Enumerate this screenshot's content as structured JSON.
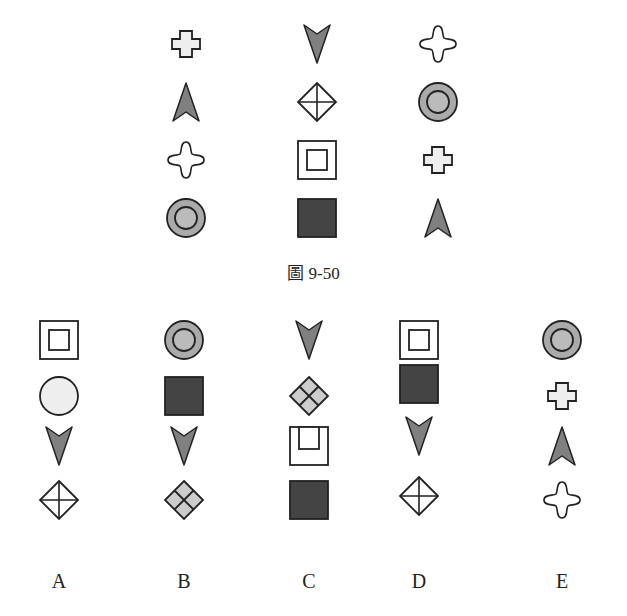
{
  "figure": {
    "caption": "圖 9-50",
    "colors": {
      "stroke": "#222222",
      "light_fill": "#eeeeee",
      "mid_fill": "#aaaaaa",
      "arrow_fill": "#808080",
      "dark_fill": "#444444",
      "white": "#ffffff"
    },
    "grid": {
      "columns": [
        [
          "cross",
          "arrow-up",
          "four-point-star",
          "ring"
        ],
        [
          "arrow-down",
          "diamond-cross",
          "nested-square",
          "dark-square"
        ],
        [
          "four-point-star",
          "ring",
          "cross",
          "arrow-up"
        ]
      ]
    }
  },
  "options": [
    {
      "label": "A",
      "shapes": [
        "nested-square",
        "circle",
        "arrow-down",
        "diamond-cross"
      ]
    },
    {
      "label": "B",
      "shapes": [
        "ring",
        "dark-square",
        "arrow-down",
        "diamond-quad"
      ]
    },
    {
      "label": "C",
      "shapes": [
        "arrow-down",
        "diamond-quad",
        "nested-square-offset",
        "dark-square"
      ]
    },
    {
      "label": "D",
      "shapes": [
        "nested-square",
        "dark-square",
        "arrow-down",
        "diamond-cross"
      ]
    },
    {
      "label": "E",
      "shapes": [
        "ring",
        "cross",
        "arrow-up",
        "four-point-star"
      ]
    }
  ]
}
